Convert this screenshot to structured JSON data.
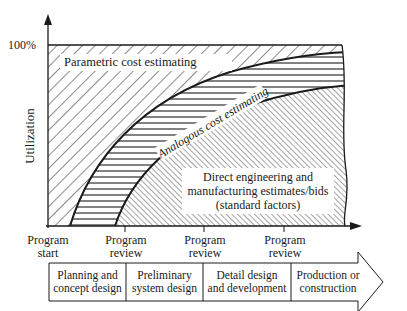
{
  "diagram": {
    "y_axis": {
      "label": "Utilization",
      "top_tick": "100%"
    },
    "regions": {
      "parametric": "Parametric cost estimating",
      "analogous": "Analogous cost estimating",
      "direct_line1": "Direct engineering and",
      "direct_line2": "manufacturing estimates/bids",
      "direct_line3": "(standard factors)"
    },
    "milestones": [
      {
        "line1": "Program",
        "line2": "start"
      },
      {
        "line1": "Program",
        "line2": "review"
      },
      {
        "line1": "Program",
        "line2": "review"
      },
      {
        "line1": "Program",
        "line2": "review"
      }
    ],
    "phases": [
      {
        "line1": "Planning and",
        "line2": "concept design"
      },
      {
        "line1": "Preliminary",
        "line2": "system design"
      },
      {
        "line1": "Detail design",
        "line2": "and development"
      },
      {
        "line1": "Production or",
        "line2": "construction"
      }
    ],
    "colors": {
      "ink": "#1a1a1a",
      "background": "#ffffff"
    }
  }
}
